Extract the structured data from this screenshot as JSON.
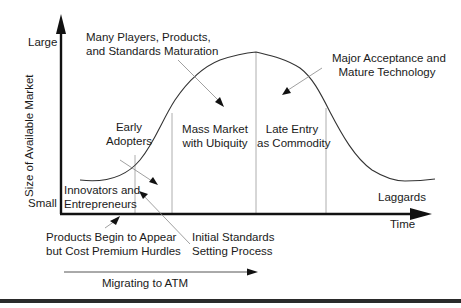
{
  "diagram": {
    "axes": {
      "y_axis_label": "Size of Available Market",
      "y_top_label": "Large",
      "y_bottom_label": "Small",
      "x_axis_label": "Time"
    },
    "phases": [
      {
        "id": "innovators",
        "line1": "Innovators and",
        "line2": "Entrepreneurs"
      },
      {
        "id": "early-adopters",
        "line1": "Early",
        "line2": "Adopters"
      },
      {
        "id": "mass-market",
        "line1": "Mass Market",
        "line2": "with Ubiquity"
      },
      {
        "id": "late-entry",
        "line1": "Late Entry",
        "line2": "as Commodity"
      },
      {
        "id": "laggards",
        "line1": "Laggards"
      }
    ],
    "annotations": [
      {
        "id": "many-players",
        "line1": "Many Players, Products,",
        "line2": "and Standards Maturation"
      },
      {
        "id": "major-acceptance",
        "line1": "Major Acceptance and",
        "line2": "Mature Technology"
      },
      {
        "id": "products-begin",
        "line1": "Products Begin to Appear",
        "line2": "but Cost Premium Hurdles"
      },
      {
        "id": "initial-standards",
        "line1": "Initial Standards",
        "line2": "Setting Process"
      }
    ],
    "migration_label": "Migrating to ATM",
    "colors": {
      "axis": "#111111",
      "curve": "#333333",
      "divider": "#9a9a9a",
      "pointer": "#888888",
      "text": "#1a1a1a"
    }
  }
}
